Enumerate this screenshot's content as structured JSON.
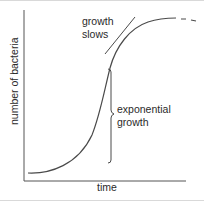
{
  "diagram": {
    "type": "bacterial growth curve",
    "axes": {
      "x_label": "time",
      "y_label": "number of bacteria"
    },
    "annotations": {
      "tangent_label_line1": "growth",
      "tangent_label_line2": "slows",
      "brace_label_line1": "exponential",
      "brace_label_line2": "growth"
    },
    "colors": {
      "line": "#4a4a4a",
      "text": "#2a2a2a",
      "background": "#ffffff"
    }
  }
}
